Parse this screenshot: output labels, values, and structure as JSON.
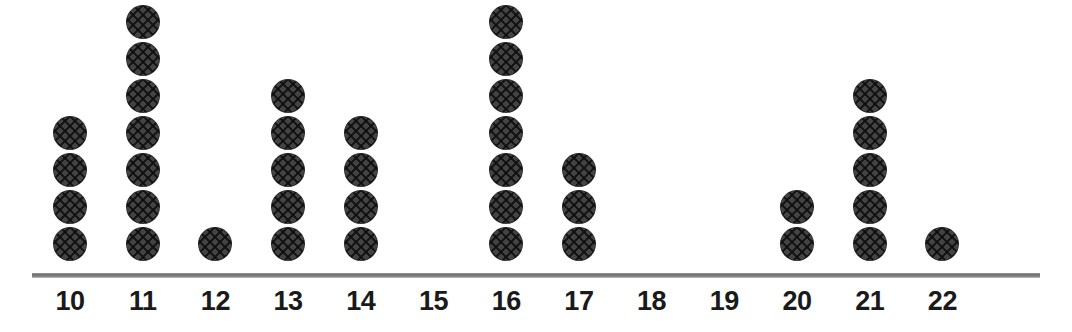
{
  "chart_data": {
    "type": "dotplot",
    "title": "",
    "xlabel": "",
    "ylabel": "",
    "categories": [
      "10",
      "11",
      "12",
      "13",
      "14",
      "15",
      "16",
      "17",
      "18",
      "19",
      "20",
      "21",
      "22"
    ],
    "values": [
      4,
      7,
      1,
      5,
      4,
      0,
      7,
      3,
      0,
      0,
      2,
      5,
      1
    ],
    "tick_labels": [
      "10",
      "11",
      "12",
      "13",
      "14",
      "15",
      "16",
      "17",
      "18",
      "19",
      "20",
      "21",
      "22"
    ],
    "xlim": [
      10,
      22
    ],
    "ylim": [
      0,
      7
    ],
    "grid": false,
    "legend": null,
    "annotations": [],
    "total_dots": 39,
    "dot_unit_value": 1,
    "colors": {
      "dot_fill": "#434343",
      "dot_hatch": "#0f0f0f",
      "axis_line": "#6d6d6d",
      "label_text": "#1a1a1a",
      "background": "#ffffff"
    }
  },
  "layout": {
    "axis_y_px": 276,
    "axis_left_px": 32,
    "axis_right_px": 1040,
    "first_column_center_px": 70,
    "column_spacing_px": 72.7,
    "dot_diameter_px": 34,
    "dot_pitch_px": 37,
    "baseline_dot_center_px": 244
  }
}
